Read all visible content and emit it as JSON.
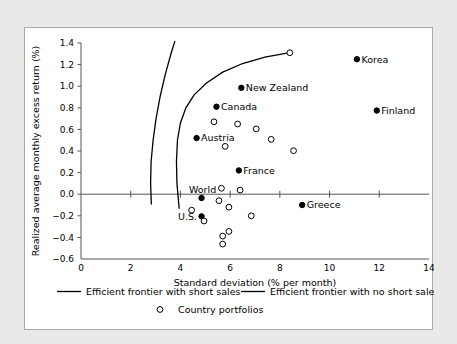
{
  "chart_data": {
    "type": "scatter",
    "title": "",
    "xlabel": "Standard deviation (% per month)",
    "ylabel": "Realized average monthly excess return (%)",
    "xlim": [
      0,
      14
    ],
    "ylim": [
      -0.6,
      1.4
    ],
    "xticks": [
      0,
      2,
      4,
      6,
      8,
      10,
      12,
      14
    ],
    "yticks": [
      -0.6,
      -0.4,
      -0.2,
      0.0,
      0.2,
      0.4,
      0.6,
      0.8,
      1.0,
      1.2,
      1.4
    ],
    "xtick_labels": [
      "0",
      "2",
      "4",
      "6",
      "8",
      "10",
      "12",
      "14"
    ],
    "ytick_labels": [
      "−0.6",
      "−0.4",
      "−0.2",
      "0.0",
      "0.2",
      "0.4",
      "0.6",
      "0.8",
      "1.0",
      "1.2",
      "1.4"
    ],
    "grid": false,
    "zero_line": true,
    "legend_position": "bottom",
    "legend": [
      {
        "label": "Efficient frontier with short sales",
        "marker": "line"
      },
      {
        "label": "Efficient frontier with no short sales",
        "marker": "line"
      },
      {
        "label": "Country portfolios",
        "marker": "open-circle"
      }
    ],
    "series": [
      {
        "name": "Labeled country portfolios",
        "marker": "filled-circle",
        "points": [
          {
            "label": "Korea",
            "x": 11.1,
            "y": 1.25,
            "label_side": "right"
          },
          {
            "label": "New Zealand",
            "x": 6.45,
            "y": 0.985,
            "label_side": "right"
          },
          {
            "label": "Canada",
            "x": 5.45,
            "y": 0.81,
            "label_side": "right"
          },
          {
            "label": "Finland",
            "x": 11.9,
            "y": 0.775,
            "label_side": "right"
          },
          {
            "label": "Austria",
            "x": 4.65,
            "y": 0.52,
            "label_side": "right"
          },
          {
            "label": "France",
            "x": 6.35,
            "y": 0.22,
            "label_side": "right"
          },
          {
            "label": "World",
            "x": 4.85,
            "y": -0.035,
            "label_side": "above-left"
          },
          {
            "label": "U.S.",
            "x": 4.85,
            "y": -0.205,
            "label_side": "left"
          },
          {
            "label": "Greece",
            "x": 8.9,
            "y": -0.1,
            "label_side": "right"
          }
        ]
      },
      {
        "name": "Country portfolios",
        "marker": "open-circle",
        "points": [
          {
            "x": 8.4,
            "y": 1.31
          },
          {
            "x": 5.35,
            "y": 0.67
          },
          {
            "x": 6.3,
            "y": 0.65
          },
          {
            "x": 7.05,
            "y": 0.605
          },
          {
            "x": 7.65,
            "y": 0.508
          },
          {
            "x": 5.8,
            "y": 0.443
          },
          {
            "x": 8.55,
            "y": 0.403
          },
          {
            "x": 5.65,
            "y": 0.055
          },
          {
            "x": 6.4,
            "y": 0.038
          },
          {
            "x": 5.55,
            "y": -0.06
          },
          {
            "x": 5.95,
            "y": -0.12
          },
          {
            "x": 4.45,
            "y": -0.148
          },
          {
            "x": 6.85,
            "y": -0.2
          },
          {
            "x": 4.95,
            "y": -0.248
          },
          {
            "x": 5.95,
            "y": -0.345
          },
          {
            "x": 5.7,
            "y": -0.388
          },
          {
            "x": 5.7,
            "y": -0.462
          }
        ]
      }
    ],
    "curves": [
      {
        "name": "Efficient frontier with short sales",
        "points": [
          {
            "x": 2.83,
            "y": -0.095
          },
          {
            "x": 2.8,
            "y": 0.1
          },
          {
            "x": 2.82,
            "y": 0.3
          },
          {
            "x": 2.9,
            "y": 0.5
          },
          {
            "x": 3.02,
            "y": 0.7
          },
          {
            "x": 3.18,
            "y": 0.9
          },
          {
            "x": 3.38,
            "y": 1.1
          },
          {
            "x": 3.62,
            "y": 1.3
          },
          {
            "x": 3.78,
            "y": 1.42
          }
        ]
      },
      {
        "name": "Efficient frontier with no short sales",
        "points": [
          {
            "x": 3.95,
            "y": -0.135
          },
          {
            "x": 3.86,
            "y": 0.1
          },
          {
            "x": 3.84,
            "y": 0.3
          },
          {
            "x": 3.88,
            "y": 0.5
          },
          {
            "x": 4.0,
            "y": 0.66
          },
          {
            "x": 4.22,
            "y": 0.8
          },
          {
            "x": 4.55,
            "y": 0.92
          },
          {
            "x": 5.05,
            "y": 1.03
          },
          {
            "x": 5.7,
            "y": 1.13
          },
          {
            "x": 6.5,
            "y": 1.21
          },
          {
            "x": 7.4,
            "y": 1.27
          },
          {
            "x": 8.4,
            "y": 1.31
          }
        ]
      }
    ]
  }
}
